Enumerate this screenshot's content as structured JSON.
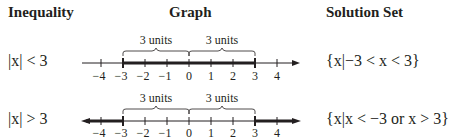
{
  "headers": {
    "inequality": "Inequality",
    "graph": "Graph",
    "solution": "Solution Set"
  },
  "rows": [
    {
      "inequality": "|x| < 3",
      "brace_left": "3 units",
      "brace_right": "3 units",
      "solution": "{x|−3 < x < 3}"
    },
    {
      "inequality": "|x| > 3",
      "brace_left": "3 units",
      "brace_right": "3 units",
      "solution": "{x|x < −3 or x > 3}"
    }
  ],
  "ticks": [
    "−4",
    "−3",
    "−2",
    "−1",
    "0",
    "1",
    "2",
    "3",
    "4"
  ]
}
